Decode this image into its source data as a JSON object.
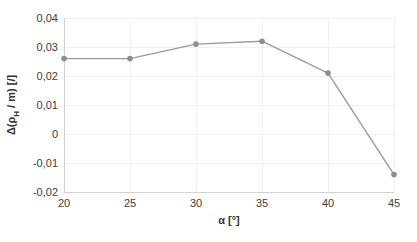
{
  "chart_data": {
    "type": "line",
    "title": "",
    "xlabel": "α [°]",
    "ylabel": "Δ(ρH / m) [/]",
    "ylabel_parts": {
      "pre": "Δ(ρ",
      "sub": "H",
      "post": " / m) [/]"
    },
    "x": [
      20,
      25,
      30,
      35,
      40,
      45
    ],
    "values": [
      0.026,
      0.026,
      0.031,
      0.032,
      0.021,
      -0.014
    ],
    "xlim": [
      20,
      45
    ],
    "ylim": [
      -0.02,
      0.04
    ],
    "x_ticks": [
      20,
      25,
      30,
      35,
      40,
      45
    ],
    "x_tick_labels": [
      "20",
      "25",
      "30",
      "35",
      "40",
      "45"
    ],
    "y_ticks": [
      -0.02,
      -0.01,
      0,
      0.01,
      0.02,
      0.03,
      0.04
    ],
    "y_tick_labels": [
      "-0,02",
      "-0,01",
      "0",
      "0,01",
      "0,02",
      "0,03",
      "0,04"
    ],
    "grid": true,
    "legend": "none",
    "line_color": "#9b9b9b",
    "marker_color": "#8e8e8e",
    "gridline_color": "#f0f0f0",
    "axis_line_color": "#d2d2d2",
    "tick_label_color": "#404040",
    "axis_title_color": "#333333",
    "background_color": "#ffffff"
  }
}
